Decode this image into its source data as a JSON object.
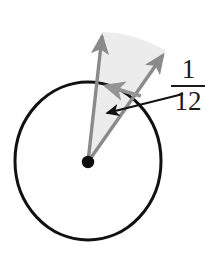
{
  "figure": {
    "canvas": {
      "width": 209,
      "height": 254,
      "background": "#ffffff"
    },
    "colors": {
      "circle_stroke": "#111111",
      "center_dot": "#0d0d0d",
      "arrow_gray": "#8a8a8a",
      "arrow_gray_dark": "#7d7d7d",
      "sector_fill": "#ececec",
      "leader_arrow": "#111111",
      "label_text": "#1a1a1a"
    },
    "circle": {
      "center_x": 88,
      "center_y": 161,
      "radius": 73,
      "stroke_width": 3
    },
    "center_dot": {
      "center_x": 88,
      "center_y": 162,
      "radius": 6
    },
    "rays": [
      {
        "name": "left-ray",
        "from_x": 88,
        "from_y": 162,
        "to_x": 102,
        "to_y": 32,
        "label": "first radius arrow"
      },
      {
        "name": "right-ray",
        "from_x": 88,
        "from_y": 162,
        "to_x": 166,
        "to_y": 51,
        "label": "second radius arrow"
      },
      {
        "name": "angle-marker-ray",
        "from_x": 141,
        "from_y": 96,
        "to_x": 102,
        "to_y": 85,
        "label": "angle marker arrow"
      }
    ],
    "sector": {
      "name": "shaded-sector",
      "center_x": 88,
      "center_y": 162,
      "start_x": 102,
      "start_y": 32,
      "end_x": 166,
      "end_y": 51,
      "fill": "#ececec"
    },
    "leader_arrow": {
      "from_x": 183,
      "from_y": 94,
      "to_x": 104,
      "to_y": 114,
      "stroke_width": 2
    },
    "label": {
      "numerator": "1",
      "denominator": "12",
      "fraction_text": "1/12",
      "value": 0.0833
    }
  }
}
